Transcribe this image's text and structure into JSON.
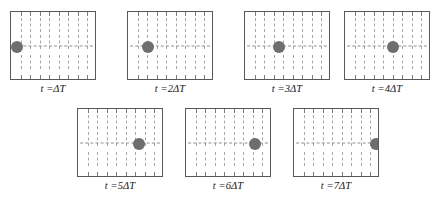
{
  "figure": {
    "colors": {
      "panel_border": "#58585a",
      "axis_dash": "#8e8e90",
      "grid_dash": "#a6a6a8",
      "edge_tick": "#7c7c7e",
      "marker": "#6e6e70",
      "background": "#ffffff",
      "caption_text": "#1a1a1a"
    },
    "symbols": {
      "time_variable": "t",
      "equals": "=",
      "delta": "Δ",
      "period": "T"
    },
    "rows": [
      {
        "name": "top-row",
        "panel_count": 4
      },
      {
        "name": "bottom-row",
        "panel_count": 3
      }
    ],
    "panels": [
      {
        "index": 1,
        "row": "top-row",
        "caption": "t =ΔT",
        "caption_coefficient": "",
        "step": 1,
        "marker_x_fraction": 0.075,
        "marker_y_fraction": 0.5,
        "marker_diameter": 12,
        "frame": {
          "x": 10,
          "y": 11,
          "w": 86,
          "h": 69
        },
        "caption_box": {
          "x": 10,
          "y": 83,
          "w": 86
        },
        "grid_columns": 8,
        "grid_bands": 3
      },
      {
        "index": 2,
        "row": "top-row",
        "caption": "t =2ΔT",
        "caption_coefficient": "2",
        "step": 2,
        "marker_x_fraction": 0.235,
        "marker_y_fraction": 0.5,
        "marker_diameter": 12,
        "frame": {
          "x": 127,
          "y": 11,
          "w": 86,
          "h": 69
        },
        "caption_box": {
          "x": 127,
          "y": 83,
          "w": 86
        },
        "grid_columns": 8,
        "grid_bands": 3
      },
      {
        "index": 3,
        "row": "top-row",
        "caption": "t =3ΔT",
        "caption_coefficient": "3",
        "step": 3,
        "marker_x_fraction": 0.4,
        "marker_y_fraction": 0.5,
        "marker_diameter": 12,
        "frame": {
          "x": 244,
          "y": 11,
          "w": 86,
          "h": 69
        },
        "caption_box": {
          "x": 244,
          "y": 83,
          "w": 86
        },
        "grid_columns": 8,
        "grid_bands": 3
      },
      {
        "index": 4,
        "row": "top-row",
        "caption": "t =4ΔT",
        "caption_coefficient": "4",
        "step": 4,
        "marker_x_fraction": 0.555,
        "marker_y_fraction": 0.5,
        "marker_diameter": 12,
        "frame": {
          "x": 344,
          "y": 11,
          "w": 86,
          "h": 69
        },
        "caption_box": {
          "x": 344,
          "y": 83,
          "w": 86
        },
        "grid_columns": 8,
        "grid_bands": 3
      },
      {
        "index": 5,
        "row": "bottom-row",
        "caption": "t =5ΔT",
        "caption_coefficient": "5",
        "step": 5,
        "marker_x_fraction": 0.715,
        "marker_y_fraction": 0.5,
        "marker_diameter": 12,
        "frame": {
          "x": 77,
          "y": 108,
          "w": 86,
          "h": 69
        },
        "caption_box": {
          "x": 77,
          "y": 180,
          "w": 86
        },
        "grid_columns": 8,
        "grid_bands": 3
      },
      {
        "index": 6,
        "row": "bottom-row",
        "caption": "t =6ΔT",
        "caption_coefficient": "6",
        "step": 6,
        "marker_x_fraction": 0.8,
        "marker_y_fraction": 0.5,
        "marker_diameter": 12,
        "frame": {
          "x": 185,
          "y": 108,
          "w": 86,
          "h": 69
        },
        "caption_box": {
          "x": 185,
          "y": 180,
          "w": 86
        },
        "grid_columns": 8,
        "grid_bands": 3
      },
      {
        "index": 7,
        "row": "bottom-row",
        "caption": "t =7ΔT",
        "caption_coefficient": "7",
        "step": 7,
        "marker_x_fraction": 0.955,
        "marker_y_fraction": 0.5,
        "marker_diameter": 12,
        "frame": {
          "x": 293,
          "y": 108,
          "w": 86,
          "h": 69
        },
        "caption_box": {
          "x": 293,
          "y": 180,
          "w": 86
        },
        "grid_columns": 8,
        "grid_bands": 3
      }
    ]
  }
}
